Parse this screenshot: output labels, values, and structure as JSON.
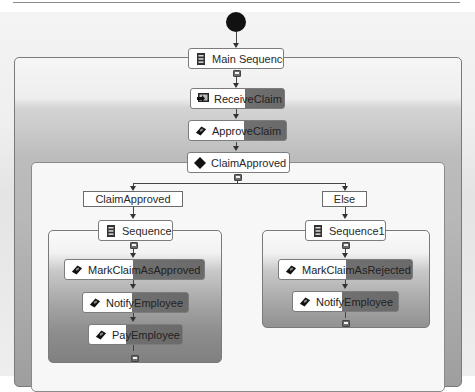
{
  "workflow": {
    "start": {
      "type": "start-node"
    },
    "main_sequence": {
      "label": "Main Sequence",
      "icon": "sequence-icon"
    },
    "activities": {
      "receive_claim": {
        "label": "ReceiveClaim",
        "icon": "receive-icon"
      },
      "approve_claim": {
        "label": "ApproveClaim",
        "icon": "activity-icon"
      },
      "if_claim_approved": {
        "label": "ClaimApproved",
        "icon": "diamond-icon"
      }
    },
    "branches": [
      {
        "condition_label": "ClaimApproved",
        "sequence": {
          "label": "Sequence",
          "icon": "sequence-icon"
        },
        "activities": [
          {
            "label": "MarkClaimAsApproved",
            "icon": "activity-icon"
          },
          {
            "label": "NotifyEmployee",
            "icon": "activity-icon"
          },
          {
            "label": "PayEmployee",
            "icon": "activity-icon"
          }
        ]
      },
      {
        "condition_label": "Else",
        "sequence": {
          "label": "Sequence1",
          "icon": "sequence-icon"
        },
        "activities": [
          {
            "label": "MarkClaimAsRejected",
            "icon": "activity-icon"
          },
          {
            "label": "NotifyEmployee",
            "icon": "activity-icon"
          }
        ]
      }
    ]
  },
  "colors": {
    "node_border": "#7c7c7c",
    "activity_dark": "#6a6a6a",
    "start_node": "#111111"
  }
}
